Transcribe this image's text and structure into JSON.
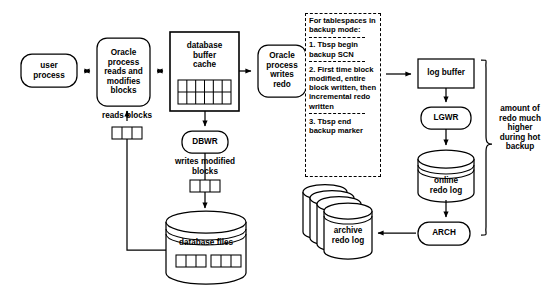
{
  "diagram": {
    "background": "#ffffff",
    "stroke": "#000000",
    "nodes": {
      "user_process": "user\nprocess",
      "oracle_process_reads": "Oracle\nprocess\nreads and\nmodifies\nblocks",
      "database_buffer_cache": "database\nbuffer\ncache",
      "oracle_process_writes_redo": "Oracle\nprocess\nwrites\nredo",
      "dbwr": "DBWR",
      "database_files": "database files",
      "log_buffer": "log buffer",
      "lgwr": "LGWR",
      "online_redo_log": "online\nredo log",
      "arch": "ARCH",
      "archive_redo_log": "archive\nredo log"
    },
    "edge_labels": {
      "reads_blocks": "reads blocks",
      "writes_modified_blocks": "writes modified\nblocks"
    },
    "note": {
      "heading": "For tablespaces\nin backup mode:",
      "items": [
        "1. Tbsp begin\nbackup SCN",
        "2. First time block\nmodified, entire\nblock written,\nthen incremental\nredo written",
        "3. Tbsp end\nbackup marker"
      ]
    },
    "brace_label": "amount\nof redo\nmuch\nhigher\nduring\nhot\nbackup",
    "block_groups": {
      "reads_blocks_cells": 3,
      "writes_modified_cells": 3,
      "buffer_cache_cols": 6,
      "buffer_cache_rows": 2,
      "database_files_groups": 2,
      "database_files_cells_per_group": 3,
      "archive_redo_log_stack": 4
    }
  }
}
